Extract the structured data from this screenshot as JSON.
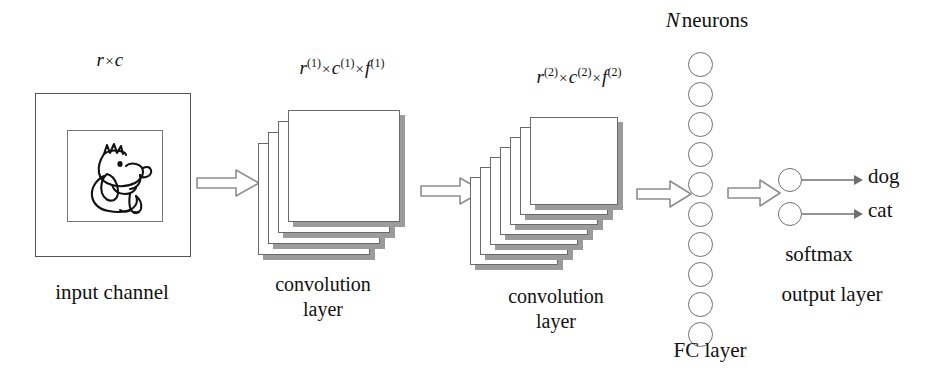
{
  "figure": {
    "background": "#ffffff",
    "ink_color": "#111111",
    "shadow_color": "#9b9b9b",
    "outline_color": "#6a6a6a"
  },
  "input_stage": {
    "dim_label": {
      "base": "r",
      "times": "×",
      "base2": "c"
    },
    "caption": "input channel",
    "image_alt": "dog line drawing"
  },
  "conv1_stage": {
    "dim_label": {
      "r": "r",
      "r_sup": "(1)",
      "c": "c",
      "c_sup": "(1)",
      "f": "f",
      "f_sup": "(1)",
      "times": "×"
    },
    "caption_line1": "convolution",
    "caption_line2": "layer",
    "card_count": 4
  },
  "conv2_stage": {
    "dim_label": {
      "r": "r",
      "r_sup": "(2)",
      "c": "c",
      "c_sup": "(2)",
      "f": "f",
      "f_sup": "(2)",
      "times": "×"
    },
    "caption_line1": "convolution",
    "caption_line2": "layer",
    "card_count": 7
  },
  "fc_stage": {
    "header": {
      "symbol": "N",
      "text": "neurons"
    },
    "caption": "FC layer",
    "neuron_count": 10
  },
  "output_stage": {
    "caption_softmax": "softmax",
    "caption_layer": "output  layer",
    "neuron_count": 2,
    "classes": [
      "dog",
      "cat"
    ]
  },
  "arrows": [
    {
      "name": "arrow-input-to-conv1"
    },
    {
      "name": "arrow-conv1-to-conv2"
    },
    {
      "name": "arrow-conv2-to-fc"
    },
    {
      "name": "arrow-fc-to-output"
    }
  ]
}
